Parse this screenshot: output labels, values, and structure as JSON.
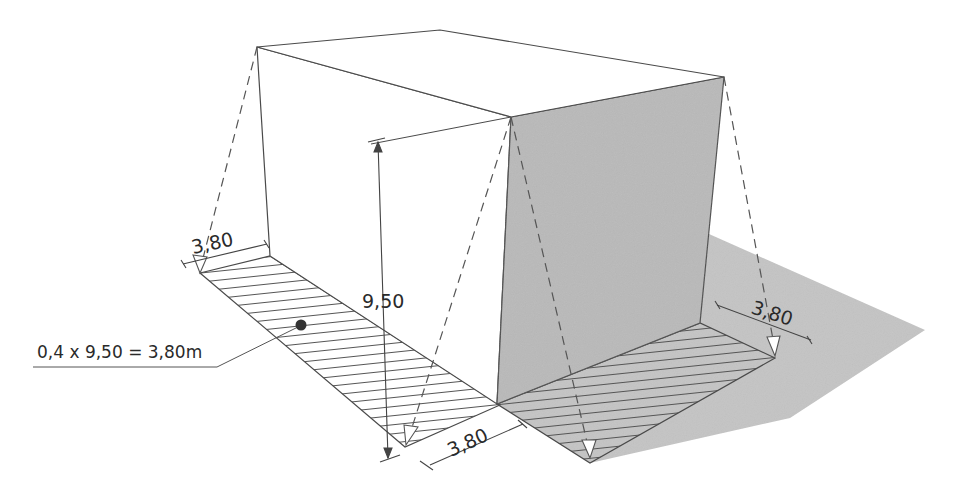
{
  "diagram": {
    "colors": {
      "line": "#4a4a4a",
      "shade_wall": "#b9b9b9",
      "shadow_ground": "#c2c2c2",
      "hatch": "#555555",
      "background": "#ffffff"
    },
    "labels": {
      "height": "9,50",
      "width_left": "3,80",
      "width_front": "3,80",
      "width_right": "3,80",
      "formula": "0,4 x 9,50 = 3,80m"
    }
  }
}
